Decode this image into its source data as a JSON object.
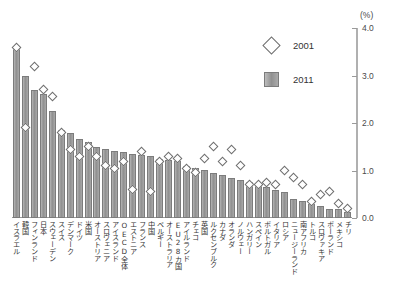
{
  "chart_data": {
    "type": "bar",
    "title": "",
    "xlabel": "",
    "ylabel": "(%)",
    "ylim": [
      0.0,
      4.0
    ],
    "yticks": [
      0.0,
      1.0,
      2.0,
      3.0,
      4.0
    ],
    "ytick_labels": [
      "0.0",
      "1.0",
      "2.0",
      "3.0",
      "4.0"
    ],
    "grid": false,
    "legend_position": "top-right",
    "categories": [
      "イスラエル",
      "韓国",
      "フィンランド",
      "日本",
      "スウェーデン",
      "スイス",
      "デンマーク",
      "ドイツ",
      "米国",
      "オーストリア",
      "スロヴェニア",
      "アイスランド",
      "OECD全体",
      "エストニア",
      "フランス",
      "中国",
      "ベルギー",
      "オーストラリア",
      "EU28カ国",
      "アイルランド",
      "チェコ",
      "英国",
      "ルクセンブルク",
      "カナダ",
      "オランダ",
      "ノルウェー",
      "ハンガリー",
      "スペイン",
      "ポルトガル",
      "イタリア",
      "ロシア",
      "ニュージーランド",
      "南アフリカ",
      "トルコ",
      "スロヴァキア",
      "ポーランド",
      "メキシコ",
      "チリ"
    ],
    "series": [
      {
        "name": "2011",
        "type": "bar",
        "values": [
          3.6,
          3.0,
          2.7,
          2.62,
          2.25,
          1.85,
          1.8,
          1.67,
          1.6,
          1.5,
          1.45,
          1.42,
          1.4,
          1.35,
          1.32,
          1.3,
          1.25,
          1.22,
          1.2,
          1.1,
          1.05,
          1.02,
          0.95,
          0.9,
          0.85,
          0.8,
          0.75,
          0.7,
          0.65,
          0.6,
          0.55,
          0.4,
          0.35,
          0.3,
          0.25,
          0.2,
          0.18,
          0.12
        ]
      },
      {
        "name": "2001",
        "type": "scatter",
        "values": [
          3.6,
          1.9,
          3.2,
          2.7,
          2.55,
          1.8,
          1.45,
          1.3,
          1.5,
          1.3,
          1.1,
          1.05,
          1.2,
          0.6,
          1.4,
          0.55,
          1.2,
          1.3,
          1.25,
          1.05,
          0.95,
          1.25,
          1.5,
          1.2,
          1.45,
          1.1,
          0.7,
          0.7,
          0.75,
          0.7,
          1.0,
          0.85,
          0.7,
          0.35,
          0.5,
          0.55,
          0.3,
          0.2
        ]
      }
    ],
    "legend": [
      {
        "label": "2001",
        "marker": "diamond-open",
        "color": "#ffffff"
      },
      {
        "label": "2011",
        "marker": "square-filled",
        "color": "#9a9a9a"
      }
    ],
    "axis_unit_label": "(%)"
  }
}
